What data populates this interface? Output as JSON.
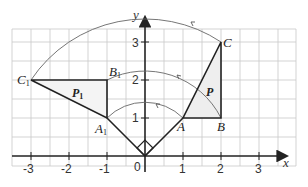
{
  "diagram": {
    "type": "rotation-transformation",
    "axes": {
      "x_label": "x",
      "y_label": "y",
      "x_ticks": [
        "-3",
        "-2",
        "-1",
        "0",
        "1",
        "2",
        "3"
      ],
      "y_ticks": [
        "1",
        "2",
        "3"
      ],
      "origin_label": "0"
    },
    "shape_P": {
      "label": "P",
      "vertices": {
        "A": {
          "label": "A",
          "x": 1,
          "y": 1
        },
        "B": {
          "label": "B",
          "x": 2,
          "y": 1
        },
        "C": {
          "label": "C",
          "x": 2,
          "y": 3
        }
      }
    },
    "shape_P1": {
      "label": "P",
      "label_sub": "1",
      "vertices": {
        "A1": {
          "label": "A",
          "sub": "1",
          "x": -1,
          "y": 1
        },
        "B1": {
          "label": "B",
          "sub": "1",
          "x": -1,
          "y": 2
        },
        "C1": {
          "label": "C",
          "sub": "1",
          "x": -3,
          "y": 2
        }
      }
    },
    "center_of_rotation": {
      "x": 0,
      "y": 0
    },
    "rotation": "90° anticlockwise about origin",
    "colors": {
      "grid": "#c8c8c8",
      "lines": "#222222",
      "arcs": "#666666",
      "shade": "#eeeeee"
    }
  }
}
